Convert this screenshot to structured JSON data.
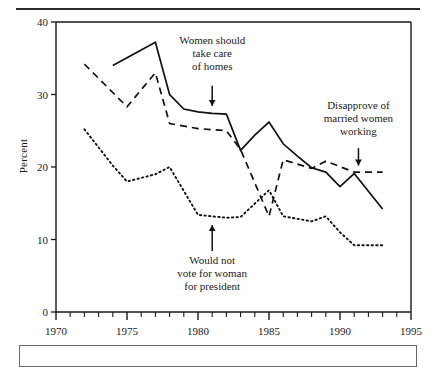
{
  "figure": {
    "top_rule": true,
    "clipped_header_text": "",
    "ytitle": "Percent"
  },
  "chart_data": {
    "type": "line",
    "title": "",
    "xlabel": "",
    "ylabel": "Percent",
    "xlim": [
      1970,
      1995
    ],
    "ylim": [
      0,
      40
    ],
    "xticks": [
      1970,
      1975,
      1980,
      1985,
      1990,
      1995
    ],
    "xtick_labels": [
      "1970",
      "1975",
      "1980",
      "1985",
      "1990",
      "1995"
    ],
    "minor_xticks_every": 1,
    "yticks": [
      0,
      10,
      20,
      30,
      40
    ],
    "ytick_labels": [
      "0",
      "10",
      "20",
      "30",
      "40"
    ],
    "grid": false,
    "legend_position": "inline-annotations",
    "series": [
      {
        "name": "Women should take care of homes",
        "style": "solid",
        "color": "#111111",
        "x": [
          1974,
          1977,
          1978,
          1979,
          1980,
          1981,
          1982,
          1983,
          1984,
          1985,
          1986,
          1987,
          1988,
          1989,
          1990,
          1991,
          1993
        ],
        "values": [
          34.0,
          37.2,
          30.0,
          28.0,
          27.6,
          27.4,
          27.3,
          22.3,
          24.4,
          26.2,
          23.2,
          21.5,
          19.9,
          19.3,
          17.3,
          19.1,
          14.2
        ]
      },
      {
        "name": "Disapprove of married women working",
        "style": "dashed",
        "color": "#111111",
        "x": [
          1972,
          1975,
          1977,
          1978,
          1980,
          1982,
          1983,
          1985,
          1986,
          1988,
          1989,
          1991,
          1992,
          1993
        ],
        "values": [
          34.2,
          28.3,
          33.0,
          26.0,
          25.3,
          25.0,
          22.4,
          13.2,
          21.0,
          19.8,
          20.8,
          19.3,
          19.3,
          19.3
        ]
      },
      {
        "name": "Would not vote for woman for president",
        "style": "dotted",
        "color": "#111111",
        "x": [
          1972,
          1974,
          1975,
          1977,
          1978,
          1980,
          1982,
          1983,
          1985,
          1986,
          1988,
          1989,
          1990,
          1991,
          1993
        ],
        "values": [
          25.2,
          20.2,
          18.0,
          19.0,
          20.0,
          13.4,
          13.0,
          13.1,
          16.8,
          13.2,
          12.5,
          13.2,
          11.0,
          9.2,
          9.2
        ]
      }
    ],
    "annotations": [
      {
        "id": "ann-homes",
        "lines": [
          "Women should",
          "take care",
          "of homes"
        ],
        "text_x": 1981.0,
        "text_y": 37.0,
        "arrow_from_x": 1981.0,
        "arrow_from_y": 31.2,
        "arrow_to_x": 1981.0,
        "arrow_to_y": 28.4
      },
      {
        "id": "ann-disapprove",
        "lines": [
          "Disapprove of",
          "married women",
          "working"
        ],
        "text_x": 1991.3,
        "text_y": 28.0,
        "arrow_from_x": 1991.3,
        "arrow_from_y": 22.6,
        "arrow_to_x": 1991.3,
        "arrow_to_y": 20.2
      },
      {
        "id": "ann-vote",
        "lines": [
          "Would not",
          "vote for woman",
          "for president"
        ],
        "text_x": 1981.0,
        "text_y": 6.6,
        "arrow_from_x": 1981.0,
        "arrow_from_y": 8.4,
        "arrow_to_x": 1981.0,
        "arrow_to_y": 12.0
      }
    ]
  }
}
